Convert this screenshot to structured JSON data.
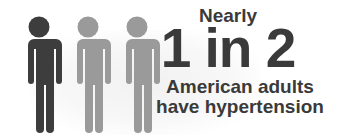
{
  "infographic": {
    "eyebrow": "Nearly",
    "ratio": "1 in 2",
    "line1": "American adults",
    "line2": "have hypertension"
  },
  "figures": [
    {
      "icon": "person-icon",
      "highlighted": true,
      "color": "#3d3d3d"
    },
    {
      "icon": "person-icon",
      "highlighted": false,
      "color": "#9a9a9a"
    },
    {
      "icon": "person-icon",
      "highlighted": false,
      "color": "#9a9a9a"
    }
  ],
  "colors": {
    "text": "#3a3a3a",
    "highlight": "#3d3d3d",
    "muted": "#9a9a9a",
    "background": "#ffffff"
  }
}
